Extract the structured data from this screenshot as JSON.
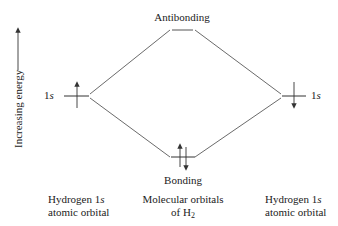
{
  "diagram": {
    "energy_axis": {
      "label": "Increasing energy",
      "direction": "up"
    },
    "levels": {
      "antibonding": {
        "label": "Antibonding",
        "electrons": []
      },
      "bonding": {
        "label": "Bonding",
        "electrons": [
          "up",
          "down"
        ]
      },
      "left_atomic": {
        "label_prefix": "1",
        "label_italic": "s",
        "electrons": [
          "up"
        ]
      },
      "right_atomic": {
        "label_prefix": "1",
        "label_italic": "s",
        "electrons": [
          "down"
        ]
      }
    },
    "captions": {
      "left": {
        "line1_prefix": "Hydrogen 1",
        "line1_italic": "s",
        "line2": "atomic orbital"
      },
      "center": {
        "line1": "Molecular orbitals",
        "line2_prefix": "of H",
        "line2_sub": "2"
      },
      "right": {
        "line1_prefix": "Hydrogen 1",
        "line1_italic": "s",
        "line2": "atomic orbital"
      }
    },
    "colors": {
      "ink": "#222222",
      "line": "#444444",
      "background": "#ffffff"
    }
  }
}
